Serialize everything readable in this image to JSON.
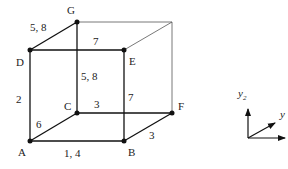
{
  "diagram": {
    "type": "cube-graph",
    "vertices": [
      {
        "id": "G",
        "label": "G",
        "x": 77,
        "y": 22
      },
      {
        "id": "H",
        "label": "",
        "x": 172,
        "y": 22
      },
      {
        "id": "D",
        "label": "D",
        "x": 30,
        "y": 50
      },
      {
        "id": "E",
        "label": "E",
        "x": 124,
        "y": 50
      },
      {
        "id": "C",
        "label": "C",
        "x": 77,
        "y": 113
      },
      {
        "id": "F",
        "label": "F",
        "x": 172,
        "y": 113
      },
      {
        "id": "A",
        "label": "A",
        "x": 30,
        "y": 141
      },
      {
        "id": "B",
        "label": "B",
        "x": 124,
        "y": 141
      }
    ],
    "edges": [
      {
        "from": "D",
        "to": "G",
        "label": "5, 8",
        "weight": "thick"
      },
      {
        "from": "D",
        "to": "E",
        "label": "7",
        "weight": "thick"
      },
      {
        "from": "G",
        "to": "C",
        "label": "5, 8",
        "weight": "thick"
      },
      {
        "from": "D",
        "to": "A",
        "label": "2",
        "weight": "thick"
      },
      {
        "from": "E",
        "to": "B",
        "label": "7",
        "weight": "thick"
      },
      {
        "from": "A",
        "to": "C",
        "label": "6",
        "weight": "thick"
      },
      {
        "from": "C",
        "to": "F",
        "label": "3",
        "weight": "thick"
      },
      {
        "from": "A",
        "to": "B",
        "label": "1, 4",
        "weight": "thick"
      },
      {
        "from": "B",
        "to": "F",
        "label": "3",
        "weight": "thick"
      },
      {
        "from": "G",
        "to": "H",
        "label": "",
        "weight": "thin"
      },
      {
        "from": "E",
        "to": "H",
        "label": "",
        "weight": "thin"
      },
      {
        "from": "H",
        "to": "F",
        "label": "",
        "weight": "thin"
      }
    ],
    "edge_labels": {
      "dg": "5, 8",
      "de": "7",
      "gc": "5, 8",
      "da": "2",
      "eb": "7",
      "ac": "6",
      "cf": "3",
      "ab": "1, 4",
      "bf": "3"
    },
    "vertex_labels": {
      "g": "G",
      "d": "D",
      "e": "E",
      "c": "C",
      "f": "F",
      "a": "A",
      "b": "B"
    }
  },
  "axes": {
    "vertical_label": "y",
    "vertical_subscript": "2",
    "diagonal_label": "y",
    "colors": {
      "line": "#111111",
      "text": "#222222"
    }
  }
}
